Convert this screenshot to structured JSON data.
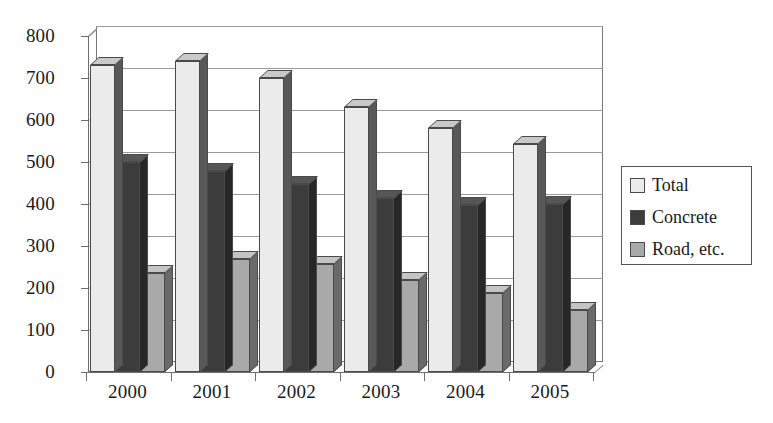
{
  "chart_data": {
    "type": "bar",
    "title": "",
    "xlabel": "",
    "ylabel": "",
    "categories": [
      "2000",
      "2001",
      "2002",
      "2003",
      "2004",
      "2005"
    ],
    "series": [
      {
        "name": "Total",
        "color": "#ebebeb",
        "values": [
          730,
          740,
          700,
          630,
          582,
          542
        ]
      },
      {
        "name": "Concrete",
        "color": "#3c3c3c",
        "values": [
          500,
          478,
          447,
          415,
          398,
          400
        ]
      },
      {
        "name": "Road, etc.",
        "color": "#a9a9a9",
        "values": [
          235,
          270,
          258,
          218,
          188,
          148
        ]
      }
    ],
    "ylim": [
      0,
      800
    ],
    "ytick_values": [
      0,
      100,
      200,
      300,
      400,
      500,
      600,
      700,
      800
    ],
    "ytick_labels": [
      "0",
      "100",
      "200",
      "300",
      "400",
      "500",
      "600",
      "700",
      "800"
    ],
    "grid": true,
    "legend_position": "right",
    "style": "3d-column"
  },
  "legend": {
    "items": [
      {
        "label": "Total",
        "swatch": "legend-swatch-total"
      },
      {
        "label": "Concrete",
        "swatch": "legend-swatch-concrete"
      },
      {
        "label": "Road, etc.",
        "swatch": "legend-swatch-road"
      }
    ]
  }
}
